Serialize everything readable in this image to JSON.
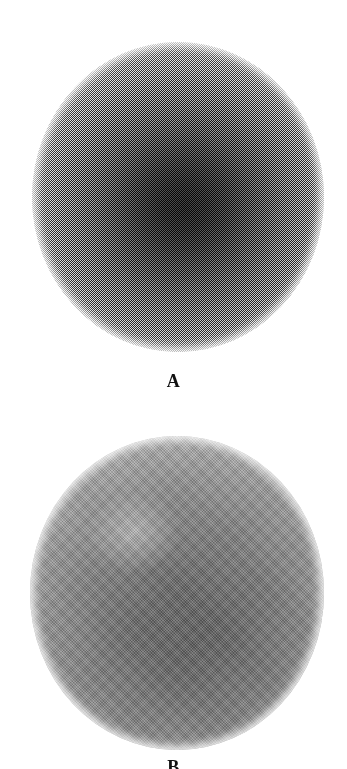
{
  "figure": {
    "background_color": "#ffffff",
    "width": 347,
    "height": 769,
    "caption_font": "serif-bold"
  },
  "panels": [
    {
      "id": "A",
      "label": "A",
      "label_visible": true,
      "description": "Speckled high-noise spherical source image",
      "rendering": "noise",
      "center_color": "#3a3a3a",
      "edge_color": "#ffffff",
      "circle": {
        "cx": 178,
        "cy": 197,
        "diameter": 292
      }
    },
    {
      "id": "B",
      "label": "B",
      "label_visible": false,
      "label_clipped": true,
      "description": "Smoothed / filtered spherical source image",
      "rendering": "smooth-halftone",
      "center_color": "#6a6a6a",
      "edge_color": "#ffffff",
      "circle": {
        "cx": 177,
        "cy": 593,
        "diameter": 294
      }
    }
  ],
  "chart_data": {
    "type": "heatmap",
    "title": "",
    "xlabel": "",
    "ylabel": "",
    "panel_labels": [
      "A",
      "B"
    ],
    "colormap": "grayscale",
    "value_min": 0,
    "value_max": 1,
    "series": [
      {
        "name": "A",
        "note": "radial intensity profile, noisy acquisition",
        "radius_fraction": [
          0.0,
          0.1,
          0.2,
          0.3,
          0.4,
          0.5,
          0.6,
          0.7,
          0.8,
          0.9,
          1.0
        ],
        "values": [
          0.93,
          0.9,
          0.85,
          0.78,
          0.68,
          0.56,
          0.42,
          0.3,
          0.19,
          0.09,
          0.0
        ]
      },
      {
        "name": "B",
        "note": "radial intensity profile, smoothed reconstruction",
        "radius_fraction": [
          0.0,
          0.12,
          0.24,
          0.36,
          0.48,
          0.6,
          0.71,
          0.81,
          0.9,
          0.96,
          1.0
        ],
        "values": [
          0.58,
          0.57,
          0.54,
          0.51,
          0.46,
          0.4,
          0.34,
          0.26,
          0.17,
          0.08,
          0.0
        ]
      }
    ],
    "legend_position": "none",
    "grid": false
  }
}
